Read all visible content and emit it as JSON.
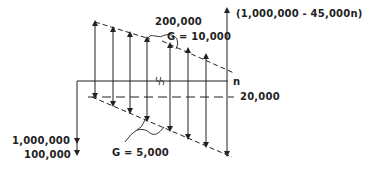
{
  "diagram": {
    "type": "cash-flow-diagram",
    "labels": {
      "top_value": "200,000",
      "top_gradient": "G = 10,000",
      "final_receipt": "(1,000,000 - 45,000n)",
      "axis_end": "n",
      "series_value": "20,000",
      "initial_cost_1": "1,000,000",
      "initial_cost_2": "100,000",
      "bottom_gradient": "G = 5,000"
    },
    "colors": {
      "ink": "#222222",
      "background": "#ffffff"
    },
    "receipt_arrow_x": [
      95,
      113,
      130,
      147,
      170,
      198,
      216
    ],
    "disbursement_arrow_x": [
      95,
      113,
      130,
      147,
      170,
      198,
      216,
      227
    ]
  }
}
